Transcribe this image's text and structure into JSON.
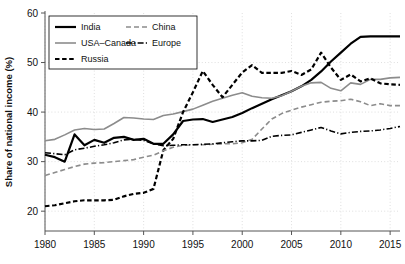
{
  "chart_data": {
    "type": "line",
    "title": "",
    "xlabel": "",
    "ylabel": "Share of national income (%)",
    "xlim": [
      1980,
      2016
    ],
    "ylim": [
      16,
      60
    ],
    "xticks": [
      1980,
      1985,
      1990,
      1995,
      2000,
      2005,
      2010,
      2015
    ],
    "yticks": [
      20,
      30,
      40,
      50,
      60
    ],
    "grid": true,
    "legend_position": "top-left",
    "x": [
      1980,
      1981,
      1982,
      1983,
      1984,
      1985,
      1986,
      1987,
      1988,
      1989,
      1990,
      1991,
      1992,
      1993,
      1994,
      1995,
      1996,
      1997,
      1998,
      1999,
      2000,
      2001,
      2002,
      2003,
      2004,
      2005,
      2006,
      2007,
      2008,
      2009,
      2010,
      2011,
      2012,
      2013,
      2014,
      2015,
      2016
    ],
    "series": [
      {
        "name": "India",
        "color": "#000000",
        "style": "solid",
        "width": 2.2,
        "values": [
          31.4,
          30.9,
          30.0,
          35.5,
          33.3,
          34.4,
          33.8,
          34.8,
          35.0,
          34.4,
          34.6,
          33.6,
          33.6,
          35.5,
          38.2,
          38.5,
          38.6,
          38.0,
          38.5,
          39.0,
          39.8,
          40.8,
          41.7,
          42.6,
          43.4,
          44.2,
          45.2,
          46.5,
          48.2,
          50.2,
          52.0,
          53.8,
          55.2,
          55.3,
          55.3,
          55.3,
          55.3
        ]
      },
      {
        "name": "USA–Canada",
        "color": "#8c8c8c",
        "style": "solid",
        "width": 1.6,
        "values": [
          34.2,
          34.5,
          35.4,
          36.4,
          36.7,
          36.5,
          36.6,
          37.7,
          38.9,
          38.8,
          38.6,
          38.5,
          39.3,
          39.6,
          40.1,
          40.6,
          41.4,
          42.2,
          42.8,
          43.4,
          43.9,
          43.2,
          42.9,
          42.8,
          43.3,
          44.2,
          45.2,
          45.9,
          46.0,
          44.8,
          44.3,
          45.9,
          45.6,
          46.6,
          46.6,
          46.9,
          47.0
        ]
      },
      {
        "name": "Russia",
        "color": "#000000",
        "style": "dashed",
        "width": 2.2,
        "values": [
          21.0,
          21.2,
          21.6,
          22.0,
          22.2,
          22.2,
          22.2,
          22.3,
          23.0,
          23.5,
          23.7,
          24.5,
          32.3,
          34.6,
          40.0,
          44.0,
          48.3,
          45.5,
          43.0,
          45.5,
          48.0,
          49.5,
          47.9,
          47.9,
          47.9,
          48.3,
          47.5,
          48.6,
          52.0,
          49.0,
          46.5,
          47.6,
          46.2,
          46.8,
          45.8,
          45.6,
          45.5
        ]
      },
      {
        "name": "China",
        "color": "#8c8c8c",
        "style": "dashed",
        "width": 1.6,
        "values": [
          27.2,
          27.8,
          28.4,
          29.0,
          29.5,
          29.7,
          29.8,
          30.0,
          30.2,
          30.4,
          30.9,
          31.3,
          32.2,
          32.9,
          33.3,
          33.4,
          33.4,
          33.5,
          33.6,
          33.6,
          33.8,
          34.5,
          36.6,
          38.6,
          39.7,
          40.4,
          41.0,
          41.5,
          42.0,
          42.2,
          42.3,
          42.6,
          42.1,
          41.3,
          41.7,
          41.3,
          41.3
        ]
      },
      {
        "name": "Europe",
        "color": "#000000",
        "style": "dashdot",
        "width": 1.6,
        "values": [
          31.8,
          31.6,
          31.4,
          32.4,
          32.7,
          33.1,
          33.4,
          33.8,
          34.4,
          34.5,
          34.3,
          33.6,
          33.2,
          33.3,
          33.4,
          33.4,
          33.5,
          33.6,
          33.8,
          34.0,
          34.2,
          34.2,
          34.3,
          35.1,
          35.3,
          35.4,
          35.9,
          36.4,
          36.9,
          36.2,
          35.6,
          35.9,
          36.1,
          36.2,
          36.4,
          36.7,
          37.1
        ]
      }
    ]
  },
  "legend": {
    "entries": [
      {
        "label": "India"
      },
      {
        "label": "USA–Canada"
      },
      {
        "label": "Russia"
      },
      {
        "label": "China"
      },
      {
        "label": "Europe"
      }
    ]
  }
}
